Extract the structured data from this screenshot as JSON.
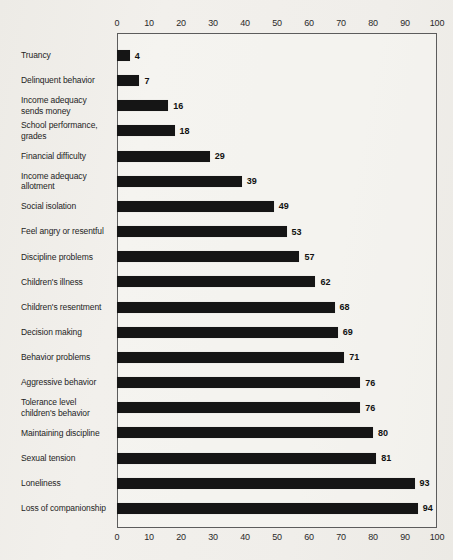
{
  "chart_data": {
    "type": "bar",
    "orientation": "horizontal",
    "title": "",
    "xlabel": "",
    "ylabel": "",
    "xlim": [
      0,
      100
    ],
    "xticks": [
      0,
      10,
      20,
      30,
      40,
      50,
      60,
      70,
      80,
      90,
      100
    ],
    "axis_positions": [
      "top",
      "bottom"
    ],
    "grid": false,
    "legend": false,
    "value_labels_shown": true,
    "categories": [
      "Truancy",
      "Delinquent behavior",
      "Income adequacy\nsends money",
      "School performance,\ngrades",
      "Financial difficulty",
      "Income adequacy\nallotment",
      "Social isolation",
      "Feel angry or resentful",
      "Discipline problems",
      "Children's illness",
      "Children's resentment",
      "Decision making",
      "Behavior problems",
      "Aggressive behavior",
      "Tolerance level\nchildren's behavior",
      "Maintaining discipline",
      "Sexual tension",
      "Loneliness",
      "Loss of companionship"
    ],
    "values": [
      4,
      7,
      16,
      18,
      29,
      39,
      49,
      53,
      57,
      62,
      68,
      69,
      71,
      76,
      76,
      80,
      81,
      93,
      94
    ]
  },
  "colors": {
    "background": "#f0eeea",
    "bar": "#151515",
    "axis_line": "#5c5c5c",
    "text": "#1c1c1c"
  }
}
